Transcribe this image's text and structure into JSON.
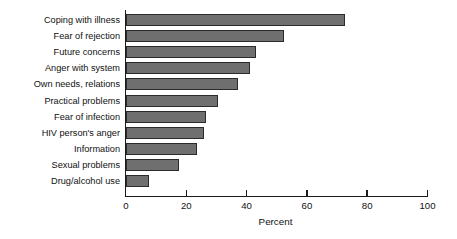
{
  "chart_data": {
    "type": "bar",
    "orientation": "horizontal",
    "title": "",
    "subtitle": "",
    "xlabel": "Percent",
    "ylabel": "",
    "xlim": [
      0,
      100
    ],
    "xticks": [
      0,
      20,
      40,
      60,
      80,
      100
    ],
    "xtick_labels": [
      "0",
      "20",
      "40",
      "60",
      "80",
      "100"
    ],
    "grid": false,
    "legend": null,
    "bar_color": "#6f6f6f",
    "bar_edge_color": "#2b2b2b",
    "axis_color": "#1a1a1a",
    "categories": [
      "Coping with illness",
      "Fear of rejection",
      "Future concerns",
      "Anger with system",
      "Own needs, relations",
      "Practical problems",
      "Fear of infection",
      "HIV person's anger",
      "Information",
      "Sexual problems",
      "Drug/alcohol use"
    ],
    "values": [
      72.5,
      52.5,
      43,
      41,
      37,
      30.5,
      26.5,
      26,
      23.5,
      17.5,
      7.5
    ]
  }
}
